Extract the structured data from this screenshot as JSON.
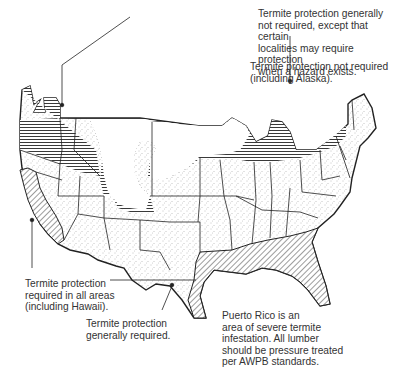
{
  "map": {
    "title": "Termite infestation probability map",
    "legend": {
      "horizontal_hatch": "Termite protection generally not required, except that certain localities may require protection when a hazard exists.",
      "blank": "Termite protection not required (including Alaska).",
      "diagonal_hatch": "Termite protection required in all areas (including Hawaii).",
      "stipple": "Termite protection generally required."
    },
    "note": "Puerto Rico is an area of severe termite infestation. All lumber should be pressure treated per AWPB standards."
  },
  "labels": {
    "horizontal": "Termite protection generally\nnot required, except that certain\nlocalities may require protection\nwhen a hazard exists.",
    "blank": "Termite protection not required\n(including Alaska).",
    "diagonal": "Termite protection\nrequired in all areas\n(including Hawaii).",
    "stipple": "Termite protection\ngenerally required.",
    "puerto_rico": "Puerto Rico is an\narea of severe termite\ninfestation. All lumber\nshould be pressure treated\nper AWPB standards."
  },
  "colors": {
    "ink": "#222222",
    "background": "#ffffff",
    "stipple": "#9a9a9a"
  }
}
